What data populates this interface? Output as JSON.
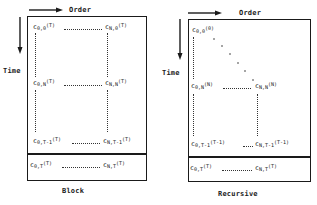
{
  "axes": {
    "order_label": "Order",
    "time_label": "Time"
  },
  "panels": [
    {
      "caption": "Block",
      "cells": {
        "top_left": {
          "base": "c",
          "sub": "0,0",
          "sup": "(T)"
        },
        "top_right": {
          "base": "c",
          "sub": "N,0",
          "sup": "(T)"
        },
        "mid_left": {
          "base": "c",
          "sub": "0,N",
          "sup": "(T)"
        },
        "mid_right": {
          "base": "c",
          "sub": "N,N",
          "sup": "(T)"
        },
        "penult_left": {
          "base": "c",
          "sub": "0,T-1",
          "sup": "(T)"
        },
        "penult_right": {
          "base": "c",
          "sub": "N,T-1",
          "sup": "(T)"
        },
        "last_left": {
          "base": "c",
          "sub": "0,T",
          "sup": "(T)"
        },
        "last_right": {
          "base": "c",
          "sub": "N,T",
          "sup": "(T)"
        }
      }
    },
    {
      "caption": "Recursive",
      "cells": {
        "top_left": {
          "base": "c",
          "sub": "0,0",
          "sup": "(0)"
        },
        "mid_left": {
          "base": "c",
          "sub": "0,N",
          "sup": "(N)"
        },
        "mid_right": {
          "base": "c",
          "sub": "N,N",
          "sup": "(N)"
        },
        "penult_left": {
          "base": "c",
          "sub": "0,T-1",
          "sup": "(T-1)"
        },
        "penult_right": {
          "base": "c",
          "sub": "N,T-1",
          "sup": "(T-1)"
        },
        "last_left": {
          "base": "c",
          "sub": "0,T",
          "sup": "(T)"
        },
        "last_right": {
          "base": "c",
          "sub": "N,T",
          "sup": "(T)"
        }
      }
    }
  ]
}
